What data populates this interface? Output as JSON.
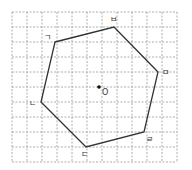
{
  "grid": {
    "x_start": 12,
    "y_start": 12,
    "spacing": 15,
    "cols": 11,
    "rows": 10
  },
  "polygon": {
    "type": "hexagon",
    "vertices": [
      {
        "label": "ㄱ",
        "x": 55,
        "y": 42,
        "lx": 44,
        "ly": 40
      },
      {
        "label": "ㅂ",
        "x": 114,
        "y": 27,
        "lx": 110,
        "ly": 22
      },
      {
        "label": "ㅁ",
        "x": 158,
        "y": 72,
        "lx": 162,
        "ly": 75
      },
      {
        "label": "ㄹ",
        "x": 144,
        "y": 132,
        "lx": 146,
        "ly": 142
      },
      {
        "label": "ㄷ",
        "x": 86,
        "y": 147,
        "lx": 81,
        "ly": 157
      },
      {
        "label": "ㄴ",
        "x": 41,
        "y": 102,
        "lx": 29,
        "ly": 106
      }
    ]
  },
  "center": {
    "label": "O",
    "x": 99,
    "y": 87,
    "lx": 102,
    "ly": 95
  },
  "labels": {
    "v1": "ㄱ",
    "v2": "ㅂ",
    "v3": "ㅁ",
    "v4": "ㄹ",
    "v5": "ㄷ",
    "v6": "ㄴ",
    "center": "O"
  }
}
